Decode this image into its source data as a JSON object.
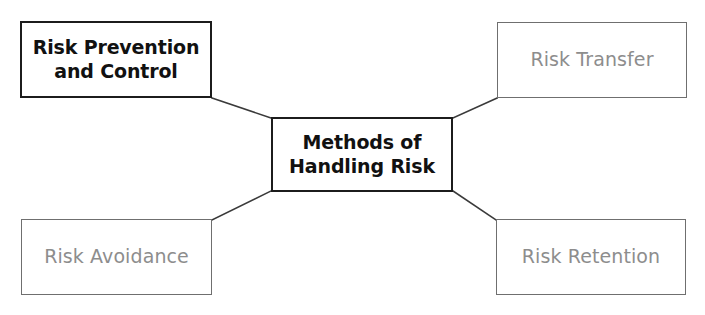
{
  "diagram": {
    "title": "Methods of Handling Risk",
    "type": "hub-and-spoke",
    "canvas": {
      "width": 705,
      "height": 315,
      "background": "#ffffff"
    },
    "colors": {
      "strong_border": "#1c1c1c",
      "strong_text": "#111111",
      "muted_border": "#6f6f6f",
      "muted_text": "#8d8d8d",
      "connector": "#3a3a3a"
    },
    "center": {
      "id": "center",
      "label": "Methods of\nHandling Risk",
      "style": "strong"
    },
    "nodes": [
      {
        "id": "prevention",
        "label": "Risk Prevention\nand Control",
        "style": "strong",
        "position": "top-left"
      },
      {
        "id": "transfer",
        "label": "Risk Transfer",
        "style": "muted",
        "position": "top-right"
      },
      {
        "id": "avoidance",
        "label": "Risk Avoidance",
        "style": "muted",
        "position": "bottom-left"
      },
      {
        "id": "retention",
        "label": "Risk Retention",
        "style": "muted",
        "position": "bottom-right"
      }
    ],
    "connectors": [
      {
        "id": "center-to-prevention",
        "from": "center",
        "to": "prevention"
      },
      {
        "id": "center-to-transfer",
        "from": "center",
        "to": "transfer"
      },
      {
        "id": "center-to-avoidance",
        "from": "center",
        "to": "avoidance"
      },
      {
        "id": "center-to-retention",
        "from": "center",
        "to": "retention"
      }
    ]
  }
}
